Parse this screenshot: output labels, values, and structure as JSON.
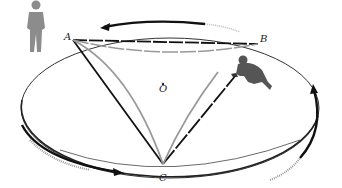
{
  "diagram": {
    "points": [
      {
        "id": "A",
        "label": "A",
        "x": 73,
        "y": 40
      },
      {
        "id": "B",
        "label": "B",
        "x": 258,
        "y": 44
      },
      {
        "id": "C",
        "label": "C",
        "x": 163,
        "y": 164
      },
      {
        "id": "O",
        "label": "O",
        "x": 163,
        "y": 90
      }
    ],
    "labels": {
      "A": "A",
      "B": "B",
      "C": "C",
      "O": "O"
    },
    "disk": {
      "cx": 170,
      "cy": 108,
      "rx": 149,
      "ry": 70
    },
    "figures": [
      {
        "name": "standing-observer",
        "position": "outside disk, top-left"
      },
      {
        "name": "kneeling-observer",
        "position": "on disk, right of center"
      }
    ],
    "rotation_direction": "counterclockwise (viewed from above)",
    "colors": {
      "straight_path": "#111111",
      "curved_path": "#9a9a9a",
      "disk_edge": "#333333",
      "figure_standing": "#8c8c8c",
      "figure_kneeling": "#555555"
    }
  }
}
